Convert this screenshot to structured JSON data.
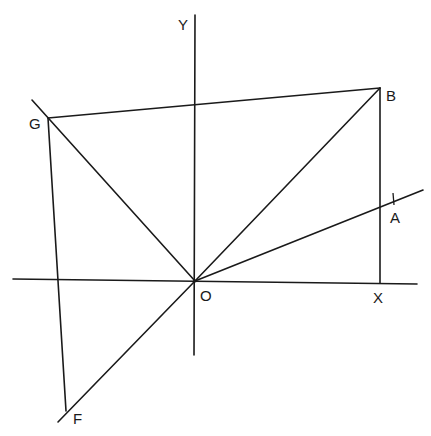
{
  "diagram": {
    "title": "",
    "stroke_color": "#1a1a1a",
    "background": "#ffffff",
    "points": {
      "O": {
        "label": "O",
        "x": 195,
        "y": 281
      },
      "B": {
        "label": "B",
        "x": 380,
        "y": 88
      },
      "G": {
        "label": "G",
        "x": 48,
        "y": 118
      },
      "F": {
        "label": "F",
        "x": 66,
        "y": 411
      },
      "X": {
        "label": "X",
        "x": 380,
        "y": 283
      },
      "A": {
        "label": "A",
        "x": 393,
        "y": 199
      },
      "Y": {
        "label": "Y",
        "x": 195,
        "y": 15
      }
    },
    "axes": {
      "x_axis": {
        "label": "X",
        "from": [
          13,
          279
        ],
        "to": [
          417,
          284
        ]
      },
      "y_axis": {
        "label": "Y",
        "from": [
          195,
          15
        ],
        "to": [
          194,
          355
        ]
      }
    },
    "segments": [
      {
        "name": "GB",
        "from": "G",
        "to": "B"
      },
      {
        "name": "BX",
        "from": "B",
        "to": "X"
      },
      {
        "name": "OB",
        "from": "O",
        "to": "B"
      },
      {
        "name": "OG",
        "from": "O",
        "to": "G"
      },
      {
        "name": "GF",
        "from": "G",
        "to": "F"
      },
      {
        "name": "OF",
        "from": "O",
        "to": "F"
      },
      {
        "name": "OA-ray",
        "from": "O",
        "to": [
          423,
          190
        ]
      }
    ],
    "labels": {
      "Y": "Y",
      "B": "B",
      "G": "G",
      "A": "A",
      "O": "O",
      "X": "X",
      "F": "F"
    }
  }
}
